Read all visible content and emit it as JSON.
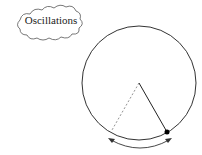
{
  "title": "Oscillations",
  "diagram": {
    "type": "pendulum",
    "elements": [
      "thought-cloud label",
      "circle boundary",
      "pendulum rod",
      "pendulum bob",
      "dashed previous position",
      "double-headed swing arrow"
    ]
  },
  "colors": {
    "stroke": "#333333",
    "background": "#ffffff"
  }
}
